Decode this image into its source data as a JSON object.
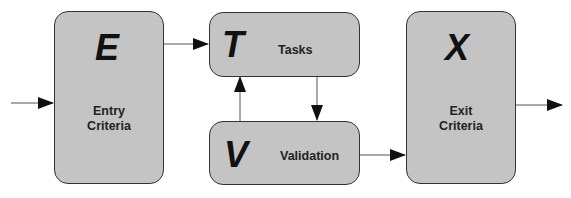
{
  "diagram": {
    "nodes": [
      {
        "id": "E",
        "letter": "E",
        "label_line1": "Entry",
        "label_line2": "Criteria"
      },
      {
        "id": "T",
        "letter": "T",
        "label": "Tasks"
      },
      {
        "id": "V",
        "letter": "V",
        "label": "Validation"
      },
      {
        "id": "X",
        "letter": "X",
        "label_line1": "Exit",
        "label_line2": "Criteria"
      }
    ],
    "edges": [
      {
        "from": "input",
        "to": "E"
      },
      {
        "from": "E",
        "to": "T"
      },
      {
        "from": "T",
        "to": "V"
      },
      {
        "from": "V",
        "to": "T"
      },
      {
        "from": "V",
        "to": "X"
      },
      {
        "from": "X",
        "to": "output"
      }
    ],
    "colors": {
      "box_fill": "#c4c4c4",
      "stroke": "#333333",
      "text": "#111111"
    }
  }
}
